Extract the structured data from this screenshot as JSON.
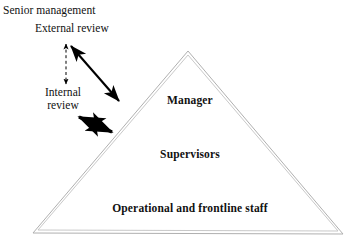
{
  "figure": {
    "background_color": "#ffffff",
    "width": 359,
    "height": 250
  },
  "triangle": {
    "name": "hierarchy-triangle",
    "stroke_color": "#b8b8b8",
    "fill_color": "#ffffff",
    "apex": {
      "x": 188,
      "y": 51
    },
    "bottom_left": {
      "x": 33,
      "y": 233
    },
    "bottom_right": {
      "x": 343,
      "y": 234
    },
    "tiers": [
      {
        "id": "manager",
        "label": "Manager"
      },
      {
        "id": "supervisors",
        "label": "Supervisors"
      },
      {
        "id": "frontline",
        "label": "Operational and frontline staff"
      }
    ]
  },
  "side_labels": {
    "senior_management": "Senior management",
    "external_review": "External review",
    "internal_review_line1": "Internal",
    "internal_review_line2": "review"
  },
  "connectors": [
    {
      "id": "external-internal-dashed-arrow",
      "style": "dashed",
      "heads": "double",
      "color": "#000000",
      "from": {
        "x": 66,
        "y": 42
      },
      "to": {
        "x": 66,
        "y": 86
      }
    },
    {
      "id": "external-review-to-manager-arrow",
      "style": "solid-thin",
      "heads": "double",
      "color": "#000000",
      "from": {
        "x": 70,
        "y": 45
      },
      "to": {
        "x": 120,
        "y": 103
      }
    },
    {
      "id": "internal-review-to-supervisors-arrow",
      "style": "solid-thick",
      "heads": "double",
      "color": "#000000",
      "from": {
        "x": 77,
        "y": 116
      },
      "to": {
        "x": 114,
        "y": 133
      }
    }
  ]
}
